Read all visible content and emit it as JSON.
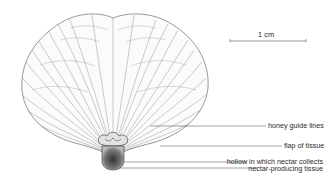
{
  "figure": {
    "type": "botanical-illustration",
    "scale_bar": {
      "label": "1 cm"
    },
    "labels": [
      {
        "id": "honey-guide-lines",
        "text": "honey guide lines"
      },
      {
        "id": "flap-of-tissue",
        "text": "flap of tissue"
      },
      {
        "id": "hollow",
        "text": "hollow in which nectar collects"
      },
      {
        "id": "nectar-tissue",
        "text": "nectar-producing tissue"
      }
    ],
    "colors": {
      "ink": "#2a2a2a",
      "background": "#ffffff"
    }
  }
}
